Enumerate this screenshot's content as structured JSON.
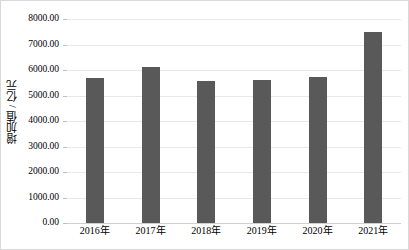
{
  "chart_data": {
    "type": "bar",
    "title": "",
    "subtitle": "",
    "xlabel": "",
    "ylabel": "增加值 / 亿元",
    "categories": [
      "2016年",
      "2017年",
      "2018年",
      "2019年",
      "2020年",
      "2021年"
    ],
    "values": [
      5700,
      6100,
      5570,
      5600,
      5730,
      7480
    ],
    "series": [
      {
        "name": "增加值",
        "values": [
          5700,
          6100,
          5570,
          5600,
          5730,
          7480
        ]
      }
    ],
    "ylim": [
      0,
      8000
    ],
    "ytick_values": [
      0,
      1000,
      2000,
      3000,
      4000,
      5000,
      6000,
      7000,
      8000
    ],
    "ytick_labels": [
      "0.00",
      "1000.00",
      "2000.00",
      "3000.00",
      "4000.00",
      "5000.00",
      "6000.00",
      "7000.00",
      "8000.00"
    ],
    "grid": true,
    "grid_axis": "y",
    "legend": false,
    "legend_position": "none",
    "bar_color": "#595959",
    "grid_color": "#e8e8e8",
    "axis_color": "#bfbfbf",
    "background_color": "#ffffff",
    "text_color": "#000000",
    "annotations": []
  }
}
